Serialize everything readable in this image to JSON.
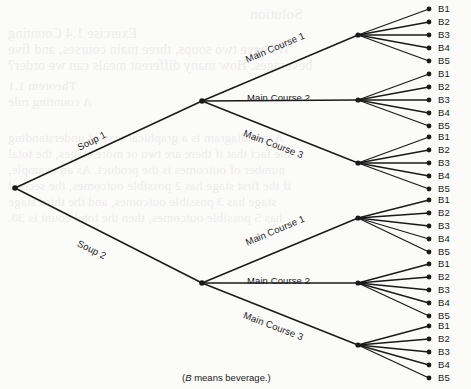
{
  "figure": {
    "type": "tree-diagram",
    "caption_prefix": "(",
    "caption_italic": "B",
    "caption_rest": " means beverage.)",
    "caption_full": "(B means beverage.)",
    "line_color": "#1a1a1a",
    "node_color": "#1a1a1a",
    "text_color": "#1a1a1a",
    "background_color": "#fbfbfa"
  },
  "tree": {
    "root": {
      "x": 15,
      "y": 188
    },
    "levels": [
      "soup",
      "main_course",
      "beverage"
    ],
    "soups": [
      {
        "label": "Soup 1",
        "node": {
          "x": 202,
          "y": 101
        },
        "label_pos": {
          "x": 78,
          "y": 143,
          "angle": -26.5
        },
        "main_courses": [
          {
            "label": "Main Course 1",
            "node": {
              "x": 358,
              "y": 35
            },
            "label_pos": {
              "x": 246,
              "y": 55,
              "angle": -23
            },
            "beverages": [
              {
                "label": "B1",
                "x": 438,
                "y": 9
              },
              {
                "label": "B2",
                "x": 438,
                "y": 22
              },
              {
                "label": "B3",
                "x": 438,
                "y": 35
              },
              {
                "label": "B4",
                "x": 438,
                "y": 48
              },
              {
                "label": "B5",
                "x": 438,
                "y": 61
              }
            ]
          },
          {
            "label": "Main Course 2",
            "node": {
              "x": 358,
              "y": 100
            },
            "label_pos": {
              "x": 247,
              "y": 93,
              "angle": 0
            },
            "beverages": [
              {
                "label": "B1",
                "x": 438,
                "y": 74
              },
              {
                "label": "B2",
                "x": 438,
                "y": 87
              },
              {
                "label": "B3",
                "x": 438,
                "y": 100
              },
              {
                "label": "B4",
                "x": 438,
                "y": 113
              },
              {
                "label": "B5",
                "x": 438,
                "y": 126
              }
            ]
          },
          {
            "label": "Main Course 3",
            "node": {
              "x": 358,
              "y": 163
            },
            "label_pos": {
              "x": 244,
              "y": 128,
              "angle": 21
            },
            "beverages": [
              {
                "label": "B1",
                "x": 438,
                "y": 137
              },
              {
                "label": "B2",
                "x": 438,
                "y": 150
              },
              {
                "label": "B3",
                "x": 438,
                "y": 163
              },
              {
                "label": "B4",
                "x": 438,
                "y": 176
              },
              {
                "label": "B5",
                "x": 438,
                "y": 189
              }
            ]
          }
        ]
      },
      {
        "label": "Soup 2",
        "node": {
          "x": 202,
          "y": 283
        },
        "label_pos": {
          "x": 78,
          "y": 238,
          "angle": 26.5
        },
        "main_courses": [
          {
            "label": "Main Course 1",
            "node": {
              "x": 358,
              "y": 218
            },
            "label_pos": {
              "x": 246,
              "y": 238,
              "angle": -23
            },
            "beverages": [
              {
                "label": "B1",
                "x": 438,
                "y": 200
              },
              {
                "label": "B2",
                "x": 438,
                "y": 213
              },
              {
                "label": "B3",
                "x": 438,
                "y": 226
              },
              {
                "label": "B4",
                "x": 438,
                "y": 239
              },
              {
                "label": "B5",
                "x": 438,
                "y": 252
              }
            ]
          },
          {
            "label": "Main Course 2",
            "node": {
              "x": 358,
              "y": 283
            },
            "label_pos": {
              "x": 247,
              "y": 276,
              "angle": 0
            },
            "beverages": [
              {
                "label": "B1",
                "x": 438,
                "y": 264
              },
              {
                "label": "B2",
                "x": 438,
                "y": 277
              },
              {
                "label": "B3",
                "x": 438,
                "y": 290
              },
              {
                "label": "B4",
                "x": 438,
                "y": 303
              },
              {
                "label": "B5",
                "x": 438,
                "y": 316
              }
            ]
          },
          {
            "label": "Main Course 3",
            "node": {
              "x": 358,
              "y": 345
            },
            "label_pos": {
              "x": 244,
              "y": 310,
              "angle": 21
            },
            "beverages": [
              {
                "label": "B1",
                "x": 438,
                "y": 326
              },
              {
                "label": "B2",
                "x": 438,
                "y": 339
              },
              {
                "label": "B3",
                "x": 438,
                "y": 352
              },
              {
                "label": "B4",
                "x": 438,
                "y": 365
              },
              {
                "label": "B5",
                "x": 438,
                "y": 378
              }
            ]
          }
        ]
      }
    ]
  },
  "caption_pos": {
    "x": 182,
    "y": 372
  },
  "bleed_text": [
    {
      "text": "Solution",
      "x": 250,
      "y": 6,
      "size": 15
    },
    {
      "text": "Exercise 1.4 Counting",
      "x": 8,
      "y": 26,
      "size": 14
    },
    {
      "text": "We have two soups, three main courses, and five",
      "x": 8,
      "y": 42,
      "size": 14
    },
    {
      "text": "beverages. How many different meals can we order?",
      "x": 8,
      "y": 58,
      "size": 14
    },
    {
      "text": "Theorem 1.1",
      "x": 8,
      "y": 78,
      "size": 13
    },
    {
      "text": "A counting rule",
      "x": 8,
      "y": 94,
      "size": 13
    },
    {
      "text": "A tree diagram is a graphical way of understanding",
      "x": 8,
      "y": 130,
      "size": 13
    },
    {
      "text": "the fact that if there are two or more stages, the total",
      "x": 8,
      "y": 146,
      "size": 13
    },
    {
      "text": "number of outcomes is the product. As an example,",
      "x": 8,
      "y": 162,
      "size": 13
    },
    {
      "text": "if the first stage has 2 possible outcomes, the second",
      "x": 8,
      "y": 178,
      "size": 13
    },
    {
      "text": "stage has 3 possible outcomes, and the third stage",
      "x": 8,
      "y": 194,
      "size": 13
    },
    {
      "text": "has 5 possible outcomes, then the total count is 30.",
      "x": 8,
      "y": 210,
      "size": 13
    }
  ]
}
